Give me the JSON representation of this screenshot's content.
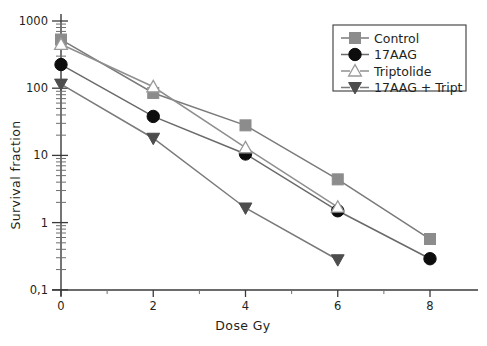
{
  "chart_data": {
    "type": "line",
    "title": "",
    "xlabel": "Dose Gy",
    "ylabel": "Survival  fraction",
    "yscale": "log",
    "ylim": [
      0.1,
      1000
    ],
    "xlim": [
      0,
      8.8
    ],
    "grid": false,
    "legend_position": "top-right",
    "x": [
      0,
      2,
      4,
      6,
      8
    ],
    "xtick_labels": [
      "0",
      "2",
      "4",
      "6",
      "8"
    ],
    "xtick_values": [
      0,
      2,
      4,
      6,
      8
    ],
    "xminor_values": [
      1,
      3,
      5,
      7
    ],
    "ytick_labels": [
      "1000",
      "100",
      "10",
      "1",
      "0,1"
    ],
    "ytick_values": [
      1000,
      100,
      10,
      1,
      0.1
    ],
    "series": [
      {
        "name": "Control",
        "marker": "square",
        "color": "#8c8c8c",
        "line_color": "#7a7a7a",
        "x": [
          0,
          2,
          4,
          6,
          8
        ],
        "values": [
          530,
          85,
          28,
          4.4,
          0.57
        ]
      },
      {
        "name": "17AAG",
        "marker": "circle",
        "color": "#0d0d0d",
        "line_color": "#6a6a6a",
        "x": [
          0,
          2,
          4,
          6,
          8
        ],
        "values": [
          225,
          38,
          10.5,
          1.5,
          0.29
        ]
      },
      {
        "name": "Triptolide",
        "marker": "triangle-up-open",
        "color": "#ffffff",
        "line_color": "#8f8f8f",
        "x": [
          0,
          2,
          4,
          6
        ],
        "values": [
          450,
          105,
          13,
          1.7
        ]
      },
      {
        "name": "17AAG + Tript",
        "marker": "triangle-down",
        "color": "#4d4d4d",
        "line_color": "#7a7a7a",
        "x": [
          0,
          2,
          4,
          6
        ],
        "values": [
          115,
          18,
          1.65,
          0.28
        ]
      }
    ]
  },
  "legend": {
    "entries": [
      {
        "label": "Control"
      },
      {
        "label": "17AAG"
      },
      {
        "label": "Triptolide"
      },
      {
        "label": "17AAG + Tript"
      }
    ]
  },
  "axes": {
    "x_title": "Dose Gy",
    "y_title": "Survival  fraction",
    "xticks": [
      {
        "label": "0"
      },
      {
        "label": "2"
      },
      {
        "label": "4"
      },
      {
        "label": "6"
      },
      {
        "label": "8"
      }
    ],
    "yticks": [
      {
        "label": "1000"
      },
      {
        "label": "100"
      },
      {
        "label": "10"
      },
      {
        "label": "1"
      },
      {
        "label": "0,1"
      }
    ]
  }
}
